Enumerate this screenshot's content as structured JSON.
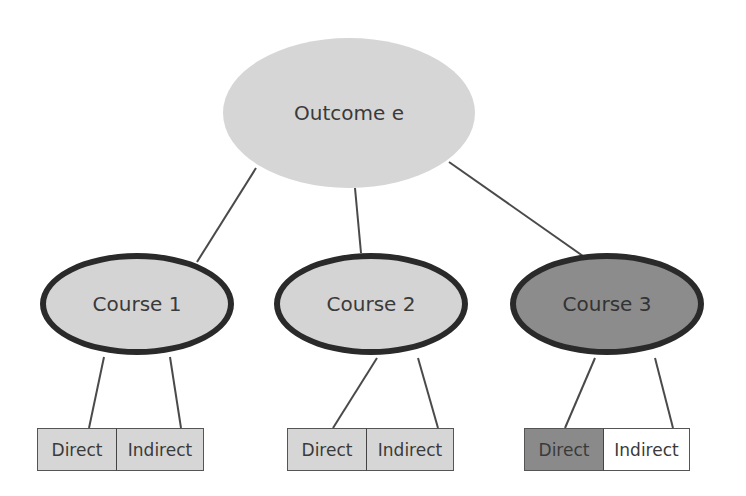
{
  "diagram": {
    "root": {
      "label": "Outcome e",
      "fill": "#d6d6d6"
    },
    "courses": [
      {
        "label": "Course 1",
        "fill": "#d4d4d4",
        "children": [
          {
            "label": "Direct",
            "fill": "#d6d6d6"
          },
          {
            "label": "Indirect",
            "fill": "#d6d6d6"
          }
        ]
      },
      {
        "label": "Course 2",
        "fill": "#d4d4d4",
        "children": [
          {
            "label": "Direct",
            "fill": "#d6d6d6"
          },
          {
            "label": "Indirect",
            "fill": "#d6d6d6"
          }
        ]
      },
      {
        "label": "Course 3",
        "fill": "#8c8c8c",
        "children": [
          {
            "label": "Direct",
            "fill": "#8a8a8a"
          },
          {
            "label": "Indirect",
            "fill": "#ffffff"
          }
        ]
      }
    ],
    "edges": [
      [
        "Outcome e",
        "Course 1"
      ],
      [
        "Outcome e",
        "Course 2"
      ],
      [
        "Outcome e",
        "Course 3"
      ],
      [
        "Course 1",
        "Direct"
      ],
      [
        "Course 1",
        "Indirect"
      ],
      [
        "Course 2",
        "Direct"
      ],
      [
        "Course 2",
        "Indirect"
      ],
      [
        "Course 3",
        "Direct"
      ],
      [
        "Course 3",
        "Indirect"
      ]
    ]
  }
}
